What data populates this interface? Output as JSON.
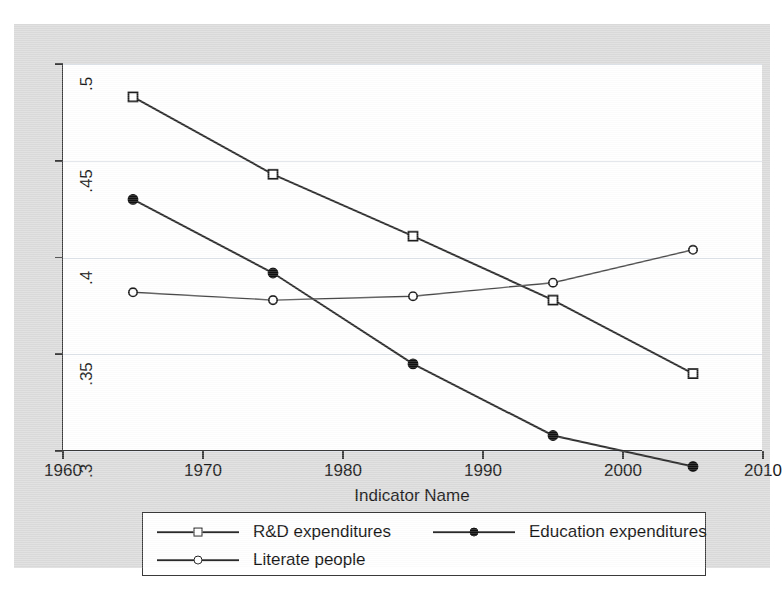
{
  "chart_data": {
    "type": "line",
    "title": "",
    "xlabel": "Indicator Name",
    "ylabel": "",
    "x": [
      1965,
      1975,
      1985,
      1995,
      2005
    ],
    "xlim": [
      1960,
      2010
    ],
    "ylim": [
      0.3,
      0.5
    ],
    "xticks": [
      "1960",
      "1970",
      "1980",
      "1990",
      "2000",
      "2010"
    ],
    "xtick_values": [
      1960,
      1970,
      1980,
      1990,
      2000,
      2010
    ],
    "yticks": [
      ".5",
      ".45",
      ".4",
      ".35",
      ".3"
    ],
    "ytick_values": [
      0.5,
      0.45,
      0.4,
      0.35,
      0.3
    ],
    "grid": true,
    "legend_position": "below-plot",
    "series": [
      {
        "name": "R&D expenditures",
        "marker": "open-square",
        "color": "#2a2a2a",
        "values": [
          0.483,
          0.443,
          0.411,
          0.378,
          0.34
        ]
      },
      {
        "name": "Education expenditures",
        "marker": "filled-circle",
        "color": "#2a2a2a",
        "values": [
          0.43,
          0.392,
          0.345,
          0.308,
          0.292
        ]
      },
      {
        "name": "Literate people",
        "marker": "open-circle",
        "color": "#4a4a4a",
        "values": [
          0.382,
          0.378,
          0.38,
          0.387,
          0.404
        ]
      }
    ]
  },
  "legend": {
    "entries": [
      {
        "label": "R&D expenditures",
        "marker": "open-square"
      },
      {
        "label": "Education expenditures",
        "marker": "filled-circle"
      },
      {
        "label": "Literate people",
        "marker": "open-circle"
      }
    ]
  },
  "axis": {
    "x_title": "Indicator Name"
  },
  "colors": {
    "page_background": "#dcdcdc",
    "plot_background": "#ffffff",
    "axis": "#3a3a3a",
    "grid": "#dfe3ea",
    "ink": "#1a1a1a"
  }
}
